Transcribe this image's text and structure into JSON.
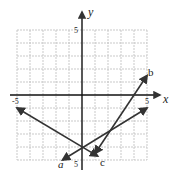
{
  "figure": {
    "axes": {
      "x_label": "x",
      "y_label": "y",
      "x_range": [
        -5,
        5
      ],
      "y_range": [
        -5,
        5
      ],
      "tick_labels": {
        "x_neg": "-5",
        "x_pos": "5",
        "y_pos": "5",
        "y_neg": "5"
      },
      "grid": true
    },
    "lines": [
      {
        "name": "a",
        "label": "a",
        "from": [
          -1.5,
          -5
        ],
        "to": [
          5,
          -1
        ],
        "note": "arrow at both ends"
      },
      {
        "name": "b",
        "label": "b",
        "from": [
          1,
          -4.5
        ],
        "to": [
          5,
          1.5
        ],
        "note": "arrow at both ends"
      },
      {
        "name": "c",
        "label": "c",
        "from": [
          -5,
          -1
        ],
        "to": [
          1.2,
          -4.7
        ],
        "note": "arrow at both ends"
      }
    ],
    "colors": {
      "line": "#333333",
      "grid": "#bbbbbb",
      "axis": "#111111"
    }
  }
}
